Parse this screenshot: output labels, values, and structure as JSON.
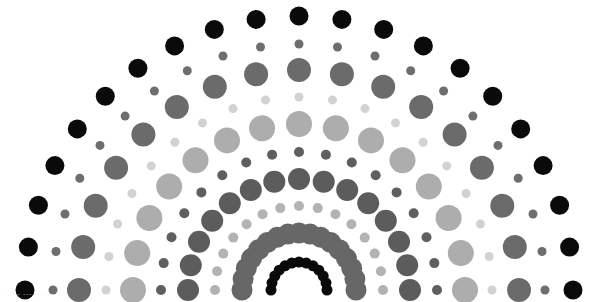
{
  "image": {
    "title": "Concentric semicircle dot pattern",
    "background": "#ffffff",
    "center": {
      "x": 299,
      "y": 290
    },
    "watermark_text": "·· ··· ··· ··· ·· ···"
  },
  "rings": [
    {
      "name": "outer-black",
      "radius": 274,
      "dot_radius": 9.5,
      "count": 21,
      "color": "#0a0a0a"
    },
    {
      "name": "small-darkgray-1",
      "radius": 246,
      "dot_radius": 4.5,
      "count": 21,
      "color": "#6e6e6e"
    },
    {
      "name": "large-midgray",
      "radius": 220,
      "dot_radius": 12,
      "count": 17,
      "color": "#6b6b6b"
    },
    {
      "name": "tiny-light-1",
      "radius": 193,
      "dot_radius": 4.5,
      "count": 19,
      "color": "#d2d2d2"
    },
    {
      "name": "large-lightgray",
      "radius": 166,
      "dot_radius": 13,
      "count": 15,
      "color": "#adadad"
    },
    {
      "name": "small-dark-2",
      "radius": 138,
      "dot_radius": 5,
      "count": 17,
      "color": "#5f5f5f"
    },
    {
      "name": "medium-dark",
      "radius": 111,
      "dot_radius": 11,
      "count": 15,
      "color": "#5c5c5c"
    },
    {
      "name": "tiny-light-2",
      "radius": 84,
      "dot_radius": 5,
      "count": 15,
      "color": "#b3b3b3"
    },
    {
      "name": "dense-darkgray",
      "radius": 57,
      "dot_radius": 10.5,
      "count": 17,
      "color": "#676767"
    },
    {
      "name": "inner-black",
      "radius": 28,
      "dot_radius": 5.5,
      "count": 13,
      "color": "#0a0a0a"
    }
  ]
}
